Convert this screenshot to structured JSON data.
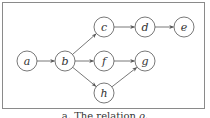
{
  "diagram": {
    "nodes": [
      {
        "id": "a",
        "label": "a",
        "x": 27,
        "y": 61
      },
      {
        "id": "b",
        "label": "b",
        "x": 65,
        "y": 61
      },
      {
        "id": "c",
        "label": "c",
        "x": 104,
        "y": 27
      },
      {
        "id": "d",
        "label": "d",
        "x": 145,
        "y": 27
      },
      {
        "id": "e",
        "label": "e",
        "x": 184,
        "y": 27
      },
      {
        "id": "f",
        "label": "f",
        "x": 104,
        "y": 61
      },
      {
        "id": "g",
        "label": "g",
        "x": 145,
        "y": 61
      },
      {
        "id": "h",
        "label": "h",
        "x": 104,
        "y": 93
      }
    ],
    "edges": [
      {
        "from": "a",
        "to": "b"
      },
      {
        "from": "b",
        "to": "c"
      },
      {
        "from": "b",
        "to": "f"
      },
      {
        "from": "b",
        "to": "h"
      },
      {
        "from": "c",
        "to": "d"
      },
      {
        "from": "d",
        "to": "e"
      },
      {
        "from": "f",
        "to": "g"
      },
      {
        "from": "h",
        "to": "g"
      }
    ],
    "node_radius": 10
  },
  "caption": {
    "prefix": "a. The relation ",
    "symbol": "ρ",
    "suffix": "."
  }
}
